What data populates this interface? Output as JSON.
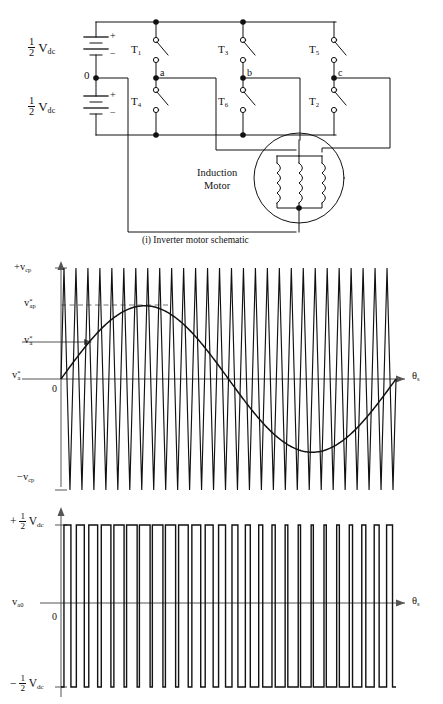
{
  "figure": {
    "caption": "(i) Inverter motor schematic",
    "domain": "power-electronics-diagram"
  },
  "schematic": {
    "supply_top_label": "V",
    "supply_top_sub": "dc",
    "supply_bottom_label": "V",
    "supply_bottom_sub": "dc",
    "fraction_num": "1",
    "fraction_den": "2",
    "midpoint_label": "0",
    "plus": "+",
    "minus": "−",
    "switches": [
      {
        "name": "T",
        "index": "1",
        "leg": "a",
        "position": "upper"
      },
      {
        "name": "T",
        "index": "3",
        "leg": "b",
        "position": "upper"
      },
      {
        "name": "T",
        "index": "5",
        "leg": "c",
        "position": "upper"
      },
      {
        "name": "T",
        "index": "4",
        "leg": "a",
        "position": "lower"
      },
      {
        "name": "T",
        "index": "6",
        "leg": "b",
        "position": "lower"
      },
      {
        "name": "T",
        "index": "2",
        "leg": "c",
        "position": "lower"
      }
    ],
    "phase_nodes": [
      "a",
      "b",
      "c"
    ],
    "motor_label_line1": "Induction",
    "motor_label_line2": "Motor",
    "motor_phases": 3,
    "coil_loops": 4
  },
  "chart_data": [
    {
      "type": "line",
      "id": "pwm-modulation",
      "title": "",
      "xlabel": "θs",
      "ylabel": "",
      "axis_x_label_main": "θ",
      "axis_x_label_sub": "s",
      "origin_label": "0",
      "ylim": [
        -1,
        1
      ],
      "xlim": [
        0,
        360
      ],
      "grid": false,
      "legend": "none",
      "ytick_labels": [
        {
          "text_main": "+v",
          "text_sub": "cp",
          "value": 1.0
        },
        {
          "text_main": "v",
          "text_sup": "*",
          "text_sub": "ap",
          "value": 0.66
        },
        {
          "text_main": "v",
          "text_sup": "*",
          "text_sub": "a",
          "value": 0.33
        },
        {
          "text_main": "v",
          "text_sup": "*",
          "text_sub": "a",
          "value": 0.0
        },
        {
          "text_main": "−v",
          "text_sub": "cp",
          "value": -1.0
        }
      ],
      "series": [
        {
          "name": "carrier",
          "kind": "triangle",
          "cycles": 28,
          "amplitude": 1.0,
          "description": "triangular carrier wave v_cp, peak-to-peak between +v_cp and -v_cp"
        },
        {
          "name": "reference",
          "kind": "sine",
          "cycles": 1,
          "amplitude": 0.66,
          "phase_deg": 0,
          "description": "sinusoidal modulating reference v*_a with peak v*_ap"
        }
      ],
      "annotations": [
        {
          "kind": "dashed-line",
          "at_y": 0.66,
          "label": "v*_ap peak level"
        },
        {
          "kind": "arrow-line",
          "at_y": 0.33,
          "label": "v*_a instantaneous level"
        }
      ]
    },
    {
      "type": "line",
      "id": "pole-voltage",
      "title": "",
      "xlabel": "θs",
      "ylabel": "va0",
      "axis_x_label_main": "θ",
      "axis_x_label_sub": "s",
      "axis_y_label_main": "v",
      "axis_y_label_sub": "a0",
      "origin_label": "0",
      "ylim": [
        -1,
        1
      ],
      "xlim": [
        0,
        360
      ],
      "grid": false,
      "legend": "none",
      "ytick_labels": [
        {
          "text": "+ 1/2 Vdc",
          "sign": "+",
          "num": "1",
          "den": "2",
          "main": "V",
          "sub": "dc",
          "value": 1.0
        },
        {
          "text": "− 1/2 Vdc",
          "sign": "−",
          "num": "1",
          "den": "2",
          "main": "V",
          "sub": "dc",
          "value": -1.0
        }
      ],
      "series": [
        {
          "name": "pole voltage",
          "kind": "square-pwm",
          "pulses": 26,
          "amplitude": 1.0,
          "description": "two-level PWM pole voltage v_a0 switching between +Vdc/2 and -Vdc/2 with sinusoidally varying duty ratio"
        }
      ]
    }
  ]
}
